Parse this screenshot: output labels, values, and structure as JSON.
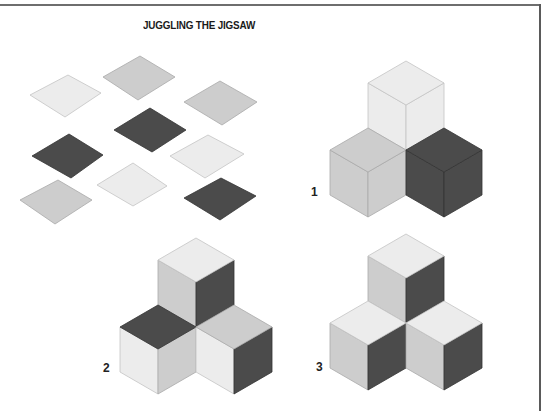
{
  "title": "JUGGLING THE JIGSAW",
  "colors": {
    "very_light": "#ececec",
    "light": "#cdcdcd",
    "dark": "#4b4b4b",
    "frame": "#5a5a5a"
  },
  "loose_tiles": [
    {
      "id": "tile-1",
      "shade": "very_light",
      "points": [
        [
          30,
          95
        ],
        [
          68,
          75
        ],
        [
          101,
          93
        ],
        [
          65,
          117
        ]
      ]
    },
    {
      "id": "tile-2",
      "shade": "light",
      "points": [
        [
          103,
          77
        ],
        [
          140,
          56
        ],
        [
          175,
          77
        ],
        [
          138,
          100
        ]
      ]
    },
    {
      "id": "tile-3",
      "shade": "light",
      "points": [
        [
          184,
          102
        ],
        [
          220,
          81
        ],
        [
          257,
          102
        ],
        [
          222,
          125
        ]
      ]
    },
    {
      "id": "tile-4",
      "shade": "dark",
      "points": [
        [
          114,
          130
        ],
        [
          150,
          108
        ],
        [
          186,
          130
        ],
        [
          152,
          152
        ]
      ]
    },
    {
      "id": "tile-5",
      "shade": "dark",
      "points": [
        [
          32,
          156
        ],
        [
          69,
          134
        ],
        [
          103,
          155
        ],
        [
          71,
          178
        ]
      ]
    },
    {
      "id": "tile-6",
      "shade": "very_light",
      "points": [
        [
          170,
          156
        ],
        [
          208,
          135
        ],
        [
          244,
          154
        ],
        [
          205,
          178
        ]
      ]
    },
    {
      "id": "tile-7",
      "shade": "light",
      "points": [
        [
          20,
          200
        ],
        [
          58,
          180
        ],
        [
          92,
          200
        ],
        [
          55,
          224
        ]
      ]
    },
    {
      "id": "tile-8",
      "shade": "very_light",
      "points": [
        [
          97,
          185
        ],
        [
          133,
          163
        ],
        [
          167,
          186
        ],
        [
          133,
          206
        ]
      ]
    },
    {
      "id": "tile-9",
      "shade": "dark",
      "points": [
        [
          184,
          198
        ],
        [
          221,
          178
        ],
        [
          256,
          196
        ],
        [
          220,
          220
        ]
      ]
    }
  ],
  "figures": [
    {
      "label": "1",
      "label_pos": [
        311,
        185
      ],
      "center": [
        406,
        150
      ],
      "cubes": {
        "top": {
          "top": "very_light",
          "left": "very_light",
          "right": "very_light"
        },
        "left": {
          "top": "light",
          "left": "light",
          "right": "light"
        },
        "right": {
          "top": "dark",
          "left": "dark",
          "right": "dark"
        }
      }
    },
    {
      "label": "2",
      "label_pos": [
        103,
        361
      ],
      "center": [
        196,
        327
      ],
      "cubes": {
        "top": {
          "top": "very_light",
          "left": "light",
          "right": "dark"
        },
        "left": {
          "top": "dark",
          "left": "very_light",
          "right": "light"
        },
        "right": {
          "top": "light",
          "left": "very_light",
          "right": "dark"
        }
      }
    },
    {
      "label": "3",
      "label_pos": [
        316,
        360
      ],
      "center": [
        406,
        323
      ],
      "cubes": {
        "top": {
          "top": "very_light",
          "left": "light",
          "right": "dark"
        },
        "left": {
          "top": "very_light",
          "left": "light",
          "right": "dark"
        },
        "right": {
          "top": "very_light",
          "left": "light",
          "right": "dark"
        }
      }
    }
  ],
  "geometry": {
    "edge_dx": 38,
    "edge_dy": 22,
    "edge_v": 45
  }
}
